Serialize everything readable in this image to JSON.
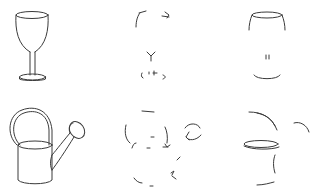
{
  "figure": {
    "layout": {
      "rows": 2,
      "cols": 3
    },
    "rows": [
      {
        "object": "wine glass",
        "cells": [
          {
            "name": "wine-glass-full-sketch",
            "variant": "complete"
          },
          {
            "name": "wine-glass-sparse-strokes",
            "variant": "partial-fragments"
          },
          {
            "name": "wine-glass-partial-strokes",
            "variant": "partial-contours"
          }
        ]
      },
      {
        "object": "watering can",
        "cells": [
          {
            "name": "watering-can-full-sketch",
            "variant": "complete"
          },
          {
            "name": "watering-can-sparse-strokes",
            "variant": "partial-fragments"
          },
          {
            "name": "watering-can-partial-strokes",
            "variant": "partial-contours"
          }
        ]
      }
    ],
    "stroke_color": "#3a3a3a",
    "background": "#ffffff"
  }
}
